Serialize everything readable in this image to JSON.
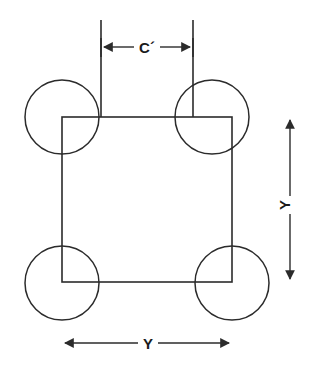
{
  "diagram": {
    "background_color": "#ffffff",
    "line_color": "#2b2b2b",
    "text_color": "#1a1a1a",
    "labels": {
      "top_dimension": "C´",
      "right_dimension": "Y",
      "bottom_dimension": "Y"
    },
    "geometry": {
      "square": {
        "x": 62,
        "y": 117,
        "width": 170,
        "height": 165
      },
      "circle_radius": 37,
      "circles": [
        {
          "name": "top-left",
          "cx": 62,
          "cy": 117
        },
        {
          "name": "top-right",
          "cx": 212,
          "cy": 117
        },
        {
          "name": "bottom-left",
          "cx": 62,
          "cy": 283
        },
        {
          "name": "bottom-right",
          "cx": 232,
          "cy": 283
        }
      ],
      "extension_lines": [
        {
          "x": 101,
          "y1": 20,
          "y2": 117
        },
        {
          "x": 193,
          "y1": 20,
          "y2": 117
        }
      ],
      "top_dimension_line": {
        "y": 47,
        "x1": 101,
        "x2": 193
      },
      "right_dimension_line": {
        "x": 290,
        "y1": 118,
        "y2": 281
      },
      "bottom_dimension_line": {
        "y": 343,
        "x1": 62,
        "x2": 232
      }
    }
  }
}
